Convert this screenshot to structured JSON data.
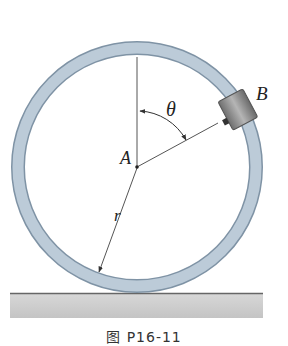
{
  "figure": {
    "labels": {
      "center": "A",
      "collar": "B",
      "angle": "θ",
      "radius": "r"
    },
    "caption": "图 P16-11",
    "colors": {
      "ring_fill": "#b9cad8",
      "ring_edge": "#7f93a5",
      "collar": "#8a8a8a",
      "ground": "#cfcfcf",
      "lines": "#444444"
    }
  }
}
